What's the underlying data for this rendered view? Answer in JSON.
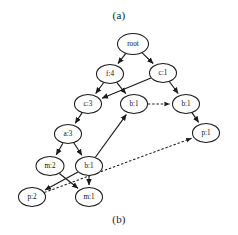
{
  "figure": {
    "caption_top": "(a)",
    "caption_bottom": "(b)",
    "colors": {
      "background": "#ffffff",
      "stroke": "#1a1a1a",
      "node_fill": "#ffffff",
      "text": "#111111"
    }
  },
  "graph": {
    "type": "tree",
    "node_shape": "ellipse",
    "nodes": [
      {
        "id": "root",
        "label": "root",
        "x": 133,
        "y": 44,
        "rx": 15.5,
        "ry": 10.5
      },
      {
        "id": "f4",
        "label": "f:4",
        "x": 110,
        "y": 74,
        "rx": 13.5,
        "ry": 9.5
      },
      {
        "id": "c1a",
        "label": "c:1",
        "x": 163,
        "y": 73,
        "rx": 13.5,
        "ry": 9.5
      },
      {
        "id": "c3",
        "label": "c:3",
        "x": 88,
        "y": 104,
        "rx": 13.5,
        "ry": 9.5
      },
      {
        "id": "b1mid",
        "label": "b:1",
        "x": 134,
        "y": 104,
        "rx": 13.5,
        "ry": 9.5
      },
      {
        "id": "b1rt",
        "label": "b:1",
        "x": 186,
        "y": 104,
        "rx": 13.5,
        "ry": 9.5
      },
      {
        "id": "a3",
        "label": "a:3",
        "x": 68,
        "y": 134,
        "rx": 13.5,
        "ry": 9.5
      },
      {
        "id": "p1",
        "label": "p:1",
        "x": 206,
        "y": 133,
        "rx": 13.5,
        "ry": 9.5
      },
      {
        "id": "m2",
        "label": "m:2",
        "x": 50,
        "y": 166,
        "rx": 14.0,
        "ry": 9.5
      },
      {
        "id": "b1low",
        "label": "b:1",
        "x": 89,
        "y": 166,
        "rx": 13.5,
        "ry": 9.5
      },
      {
        "id": "p2",
        "label": "p:2",
        "x": 32,
        "y": 197,
        "rx": 13.5,
        "ry": 9.5
      },
      {
        "id": "m1",
        "label": "m:1",
        "x": 89,
        "y": 197,
        "rx": 13.5,
        "ry": 9.5
      }
    ],
    "edges": [
      {
        "from": "root",
        "to": "f4",
        "style": "solid"
      },
      {
        "from": "root",
        "to": "c1a",
        "style": "solid"
      },
      {
        "from": "f4",
        "to": "c3",
        "style": "solid"
      },
      {
        "from": "f4",
        "to": "b1mid",
        "style": "solid"
      },
      {
        "from": "c1a",
        "to": "b1rt",
        "style": "solid"
      },
      {
        "from": "c1a",
        "to": "c3",
        "style": "solid"
      },
      {
        "from": "c3",
        "to": "a3",
        "style": "solid"
      },
      {
        "from": "b1rt",
        "to": "p1",
        "style": "solid"
      },
      {
        "from": "a3",
        "to": "m2",
        "style": "solid"
      },
      {
        "from": "a3",
        "to": "b1low",
        "style": "solid"
      },
      {
        "from": "b1low",
        "to": "b1mid",
        "style": "solid"
      },
      {
        "from": "b1low",
        "to": "m1",
        "style": "solid"
      },
      {
        "from": "b1low",
        "to": "p2",
        "style": "solid"
      },
      {
        "from": "m2",
        "to": "m1",
        "style": "solid"
      },
      {
        "from": "b1mid",
        "to": "b1rt",
        "style": "dashed"
      },
      {
        "from": "p2",
        "to": "p1",
        "style": "dashed"
      }
    ]
  }
}
